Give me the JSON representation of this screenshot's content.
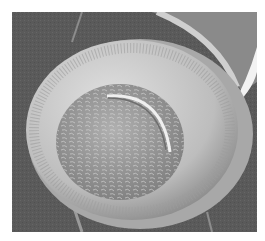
{
  "image": {
    "subject": "scanning electron micrograph of a centric diatom frustule",
    "colors": {
      "background": "#5a5a5a",
      "border": "#ffffff",
      "valve_rim": "#c8c8c8",
      "valve_face": "#9a9a9a",
      "highlight": "#ededed"
    }
  }
}
